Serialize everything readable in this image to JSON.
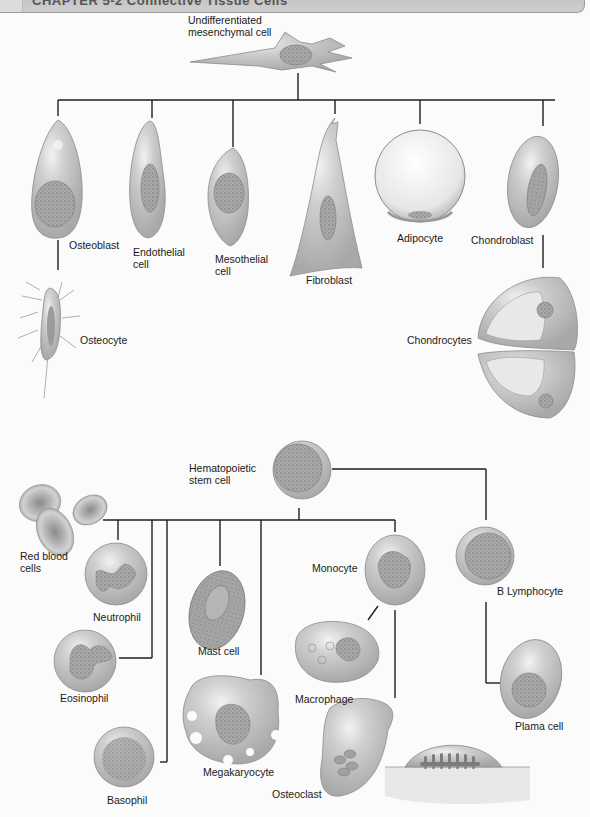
{
  "header": {
    "title": "CHAPTER 5-2 Connective Tissue Cells"
  },
  "mesenchymal_lineage": {
    "root": {
      "label_line1": "Undifferentiated",
      "label_line2": "mesenchymal cell"
    },
    "children": [
      {
        "label": "Osteoblast"
      },
      {
        "label_line1": "Endothelial",
        "label_line2": "cell"
      },
      {
        "label_line1": "Mesothelial",
        "label_line2": "cell"
      },
      {
        "label": "Fibroblast"
      },
      {
        "label": "Adipocyte"
      },
      {
        "label": "Chondroblast"
      }
    ],
    "descendants": [
      {
        "label": "Osteocyte",
        "parent": "Osteoblast"
      },
      {
        "label": "Chondrocytes",
        "parent": "Chondroblast"
      }
    ]
  },
  "hematopoietic_lineage": {
    "root": {
      "label_line1": "Hematopoietic",
      "label_line2": "stem cell"
    },
    "children": [
      {
        "label_line1": "Red blood",
        "label_line2": "cells"
      },
      {
        "label": "Neutrophil"
      },
      {
        "label": "Eosinophil"
      },
      {
        "label": "Basophil"
      },
      {
        "label": "Mast cell"
      },
      {
        "label": "Megakaryocyte"
      },
      {
        "label": "Monocyte"
      },
      {
        "label": "B Lymphocyte"
      }
    ],
    "descendants": [
      {
        "label": "Macrophage",
        "parent": "Monocyte"
      },
      {
        "label": "Osteoclast",
        "parent": "Monocyte"
      },
      {
        "label": "Plama cell",
        "parent": "B Lymphocyte"
      }
    ]
  },
  "colors": {
    "cell_fill": "#c4c4c4",
    "cell_edge": "#8c8c8c",
    "nucleus": "#9a9a9a",
    "connector": "#1e1e1e",
    "header_bg": "#c6c6c6"
  }
}
